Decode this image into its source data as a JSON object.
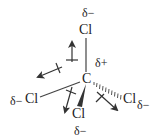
{
  "diagram": {
    "type": "molecular-structure",
    "molecule": "CCl4",
    "central_atom": {
      "symbol": "C",
      "charge": "δ+"
    },
    "substituents": [
      {
        "position": "top",
        "symbol": "Cl",
        "charge": "δ−",
        "bond": "line"
      },
      {
        "position": "left",
        "symbol": "Cl",
        "charge": "δ−",
        "bond": "line"
      },
      {
        "position": "bottom",
        "symbol": "Cl",
        "charge": "δ−",
        "bond": "wedge"
      },
      {
        "position": "right",
        "symbol": "Cl",
        "charge": "δ−",
        "bond": "hash"
      }
    ],
    "dipole_arrows": 4,
    "colors": {
      "ink": "#333333",
      "background": "#ffffff"
    }
  },
  "labels": {
    "top_charge": "δ−",
    "top_atom": "Cl",
    "center_charge": "δ+",
    "center_atom": "C",
    "left_charge": "δ−",
    "left_atom": "Cl",
    "bottom_atom": "Cl",
    "bottom_charge": "δ−",
    "right_atom": "Cl",
    "right_charge": "δ−"
  }
}
